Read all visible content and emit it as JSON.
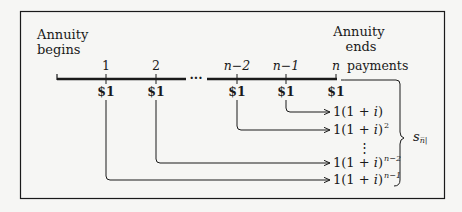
{
  "labels": {
    "start": [
      "Annuity",
      "begins"
    ],
    "end": [
      "Annuity",
      "ends"
    ],
    "payments_suffix": "payments"
  },
  "timeline": {
    "ticks": [
      {
        "label": "1",
        "x": 106
      },
      {
        "label": "2",
        "x": 156
      },
      {
        "label": "n−2",
        "x": 237
      },
      {
        "label": "n−1",
        "x": 286
      },
      {
        "label": "n",
        "x": 336
      }
    ],
    "payment": "$1",
    "ellipsis": "···"
  },
  "accumulations": [
    {
      "base": "1(1 + ",
      "var": "i",
      "close": ")",
      "exp": ""
    },
    {
      "base": "1(1 + ",
      "var": "i",
      "close": ")",
      "exp": "2"
    },
    {
      "base": "1(1 + ",
      "var": "i",
      "close": ")",
      "exp": "n−2"
    },
    {
      "base": "1(1 + ",
      "var": "i",
      "close": ")",
      "exp": "n−1"
    }
  ],
  "vertical_ellipsis": "⋮",
  "sum_label": {
    "symbol": "s",
    "subscript": "n̅|"
  },
  "colors": {
    "ink": "#1a1a1a",
    "background": "#f6f6f4"
  }
}
